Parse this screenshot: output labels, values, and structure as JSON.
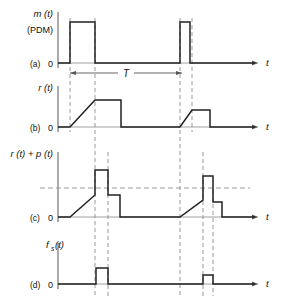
{
  "figure": {
    "type": "timing-waveform-diagram",
    "width": 291,
    "height": 299,
    "colors": {
      "signal": "#222222",
      "axis": "#555555",
      "dashed": "#999999",
      "background": "#ffffff"
    }
  },
  "panels": [
    {
      "tag": "(a)",
      "ylabel": "m (t)",
      "ylabel2": "(PDM)",
      "xlabel": "t",
      "origin_label": "0",
      "signal_name": "pdm-waveform",
      "baseline_y": 63,
      "axis_x": 58,
      "axis_top_y": 12,
      "x_end": 265,
      "pulses": [
        {
          "start": 70,
          "end": 95,
          "top": 22
        },
        {
          "start": 180,
          "end": 190,
          "top": 22
        }
      ]
    },
    {
      "tag": "(b)",
      "ylabel": "r (t)",
      "xlabel": "t",
      "origin_label": "0",
      "signal_name": "ramp-waveform",
      "baseline_y": 127,
      "axis_x": 58,
      "axis_top_y": 86,
      "x_end": 265,
      "ramps": [
        {
          "rise_start": 70,
          "rise_end": 95,
          "plateau_end": 121,
          "top": 100
        },
        {
          "rise_start": 180,
          "rise_end": 192,
          "plateau_end": 210,
          "top": 110
        }
      ]
    },
    {
      "tag": "(c)",
      "ylabel": "r (t) + p (t)",
      "xlabel": "t",
      "origin_label": "0",
      "signal_name": "ramp-plus-pulse-waveform",
      "baseline_y": 217,
      "axis_x": 58,
      "axis_top_y": 152,
      "x_end": 265,
      "threshold_y": 188,
      "threshold_x_start": 40,
      "threshold_x_end": 250,
      "events": [
        {
          "rise_start": 70,
          "rise_end": 95,
          "ramp_top": 195,
          "spike_start": 95,
          "spike_end": 108,
          "spike_top": 170,
          "step_end": 120,
          "step_top": 195
        },
        {
          "rise_start": 180,
          "rise_end": 203,
          "ramp_top": 200,
          "spike_start": 203,
          "spike_end": 213,
          "spike_top": 176,
          "step_end": 222,
          "step_top": 202
        }
      ]
    },
    {
      "tag": "(d)",
      "ylabel": "f (t)",
      "ylabel_sub": "s",
      "xlabel": "t",
      "origin_label": "0",
      "signal_name": "sampling-pulse-waveform",
      "baseline_y": 284,
      "axis_x": 58,
      "axis_top_y": 243,
      "x_end": 265,
      "pulses": [
        {
          "start": 96,
          "end": 108,
          "top": 268
        },
        {
          "start": 203,
          "end": 213,
          "top": 275
        }
      ]
    }
  ],
  "annotations": {
    "period_label": "T",
    "period_line_y": 73,
    "period_x_start": 70,
    "period_x_end": 182
  },
  "dashed_guides": {
    "vertical": [
      {
        "name": "guide-x70",
        "x": 70,
        "y_top": 18,
        "y_bottom": 132
      },
      {
        "name": "guide-x95",
        "x": 95,
        "y_top": 18,
        "y_bottom": 296
      },
      {
        "name": "guide-x108",
        "x": 108,
        "y_top": 152,
        "y_bottom": 296
      },
      {
        "name": "guide-x180",
        "x": 180,
        "y_top": 18,
        "y_bottom": 296
      },
      {
        "name": "guide-x192",
        "x": 192,
        "y_top": 18,
        "y_bottom": 132
      },
      {
        "name": "guide-x203",
        "x": 203,
        "y_top": 152,
        "y_bottom": 296
      },
      {
        "name": "guide-x213",
        "x": 213,
        "y_top": 190,
        "y_bottom": 296
      }
    ]
  }
}
